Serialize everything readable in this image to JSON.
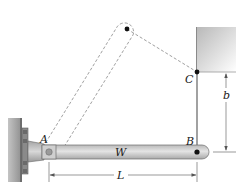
{
  "figure": {
    "type": "mechanics-diagram",
    "labels": {
      "point_a": "A",
      "point_b": "B",
      "point_c": "C",
      "weight": "W",
      "length": "L",
      "height": "b"
    },
    "colors": {
      "bar_fill": "#c8c8c8",
      "bar_stroke": "#6e6e6e",
      "wall_fill": "#9a9a9a",
      "ceiling_fill": "#d9d9d9",
      "cable": "#7a7a7a",
      "dashed": "#777777",
      "pin": "#111111"
    }
  }
}
